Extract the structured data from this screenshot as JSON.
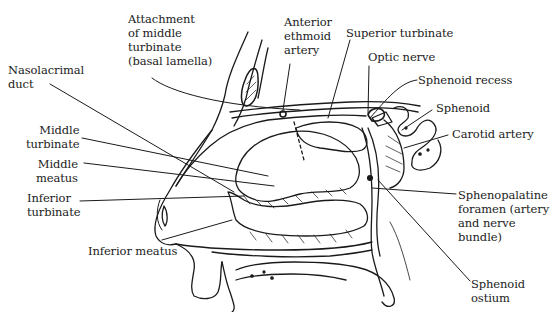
{
  "figure": {
    "type": "anatomical line drawing",
    "background": "#ffffff",
    "ink_color": "#1a1a1a"
  },
  "labels": {
    "attachment": "Attachment\nof middle\nturbinate\n(basal lamella)",
    "anterior_ethmoid": "Anterior\nethmoid\nartery",
    "superior_turbinate": "Superior turbinate",
    "optic_nerve": "Optic nerve",
    "sphenoid_recess": "Sphenoid recess",
    "sphenoid": "Sphenoid",
    "carotid": "Carotid artery",
    "nasolacrimal": "Nasolacrimal\nduct",
    "middle_turbinate": "Middle\nturbinate",
    "middle_meatus": "Middle\nmeatus",
    "inferior_turbinate": "Inferior\nturbinate",
    "inferior_meatus": "Inferior meatus",
    "sphenopalatine": "Sphenopalatine\nforamen (artery\nand nerve\nbundle)",
    "sphenoid_ostium": "Sphenoid\nostium"
  }
}
